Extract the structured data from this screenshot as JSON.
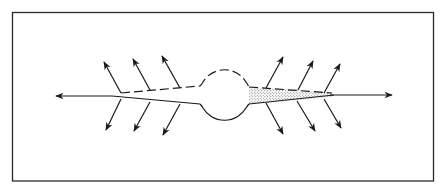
{
  "diagram": {
    "type": "schematic",
    "colors": {
      "background": "#ffffff",
      "stroke": "#1a1a1a",
      "stipple": "#555555"
    },
    "frame": {
      "x": 12,
      "y": 12,
      "width": 421,
      "height": 169
    },
    "center_circle": {
      "cx": 225,
      "cy": 95,
      "r": 25,
      "top_half": "dashed",
      "bottom_half": "solid"
    },
    "axis_arrows": [
      {
        "name": "left",
        "x1": 112,
        "y1": 96,
        "x2": 55,
        "y2": 96
      },
      {
        "name": "right",
        "x1": 334,
        "y1": 95,
        "x2": 393,
        "y2": 95
      }
    ],
    "radial_arrows": [
      {
        "side": "left",
        "pos": "upper",
        "x1": 121,
        "y1": 93,
        "x2": 104,
        "y2": 62
      },
      {
        "side": "left",
        "pos": "upper",
        "x1": 150,
        "y1": 90,
        "x2": 133,
        "y2": 59
      },
      {
        "side": "left",
        "pos": "upper",
        "x1": 180,
        "y1": 88,
        "x2": 162,
        "y2": 56
      },
      {
        "side": "left",
        "pos": "lower",
        "x1": 121,
        "y1": 99,
        "x2": 106,
        "y2": 130
      },
      {
        "side": "left",
        "pos": "lower",
        "x1": 150,
        "y1": 102,
        "x2": 134,
        "y2": 131
      },
      {
        "side": "left",
        "pos": "lower",
        "x1": 180,
        "y1": 104,
        "x2": 163,
        "y2": 135
      },
      {
        "side": "right",
        "pos": "upper",
        "x1": 266,
        "y1": 88,
        "x2": 283,
        "y2": 57
      },
      {
        "side": "right",
        "pos": "upper",
        "x1": 298,
        "y1": 90,
        "x2": 313,
        "y2": 61
      },
      {
        "side": "right",
        "pos": "upper",
        "x1": 324,
        "y1": 93,
        "x2": 340,
        "y2": 64
      },
      {
        "side": "right",
        "pos": "lower",
        "x1": 266,
        "y1": 103,
        "x2": 283,
        "y2": 134
      },
      {
        "side": "right",
        "pos": "lower",
        "x1": 297,
        "y1": 101,
        "x2": 315,
        "y2": 131
      },
      {
        "side": "right",
        "pos": "lower",
        "x1": 324,
        "y1": 99,
        "x2": 341,
        "y2": 128
      }
    ],
    "left_tube": {
      "upper_edge": "dashed",
      "lower_edge": "solid",
      "fill": "none"
    },
    "right_tube": {
      "upper_edge": "dashed",
      "lower_edge": "solid",
      "fill": "stippled"
    }
  }
}
